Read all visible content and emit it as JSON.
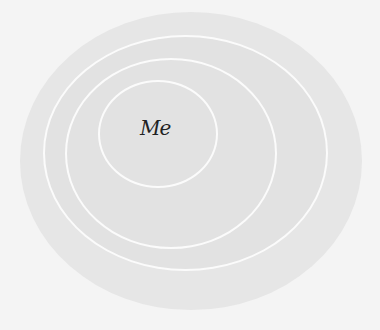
{
  "diagram": {
    "type": "concentric-circles",
    "center_label": "Me",
    "colors": {
      "background": "#f4f4f4",
      "outer_fill": "#e6e6e6",
      "inner_fill": "#e2e2e2",
      "ring_stroke": "#fbfbfb",
      "label": "#222222"
    },
    "rings": [
      {
        "name": "outer-area"
      },
      {
        "name": "ring-1"
      },
      {
        "name": "ring-2"
      },
      {
        "name": "ring-3-inner"
      }
    ]
  }
}
